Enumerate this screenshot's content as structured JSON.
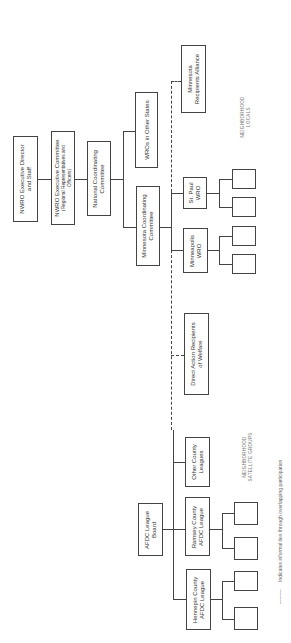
{
  "chart": {
    "orientation": "rotated 90 degrees counter-clockwise",
    "nodes": {
      "nwro_director": {
        "lines": [
          "NWRO Executive Director",
          "and Staff"
        ]
      },
      "nwro_committee": {
        "lines": [
          "NWRO Executive Committee",
          "(Regional Representatives and",
          "Officers)"
        ]
      },
      "national_coord": {
        "lines": [
          "National Coordinating",
          "Committee"
        ]
      },
      "wros_other_states": {
        "lines": [
          "WROs in Other States"
        ]
      },
      "minnesota_coord": {
        "lines": [
          "Minnesota Coordinating",
          "Committee"
        ]
      },
      "minnesota_alliance": {
        "lines": [
          "Minnesota",
          "Recipients Alliance"
        ]
      },
      "st_paul_wro": {
        "lines": [
          "St. Paul",
          "WRO"
        ]
      },
      "minneapolis_wro": {
        "lines": [
          "Minneapolis",
          "WRO"
        ]
      },
      "direct_action": {
        "lines": [
          "Direct Action Recipients",
          "of Welfare"
        ]
      },
      "other_county": {
        "lines": [
          "Other County",
          "Leagues"
        ]
      },
      "afdc_board": {
        "lines": [
          "AFDC League",
          "Board"
        ]
      },
      "ramsey": {
        "lines": [
          "Ramsey County",
          "AFDC League"
        ]
      },
      "hennepin": {
        "lines": [
          "Hennepin County",
          "AFDC League"
        ]
      }
    },
    "group_labels": {
      "neighborhood_locals": [
        "NEIGHBORHOOD",
        "LOCALS"
      ],
      "satellite_groups": [
        "NEIGHBORHOOD",
        "SATELLITE GROUPS"
      ]
    },
    "legend": {
      "dash_sample": "---------",
      "text": "Indicates informal ties through overlapping participation"
    }
  }
}
